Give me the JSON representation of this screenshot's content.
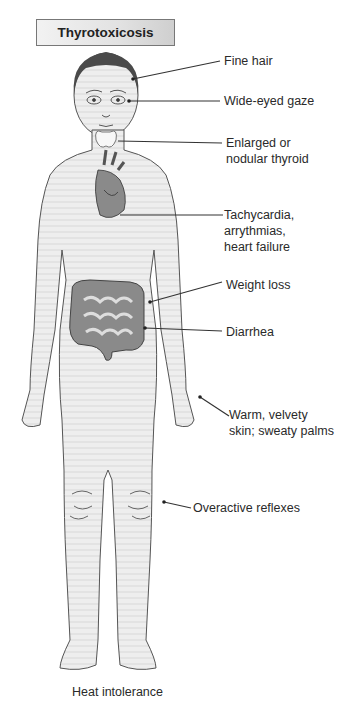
{
  "title": "Thyrotoxicosis",
  "labels": [
    {
      "id": "fine-hair",
      "text": "Fine hair"
    },
    {
      "id": "wide-eyed-gaze",
      "text": "Wide-eyed gaze"
    },
    {
      "id": "thyroid",
      "line1": "Enlarged or",
      "line2": "nodular thyroid"
    },
    {
      "id": "heart",
      "line1": "Tachycardia,",
      "line2": "arrythmias,",
      "line3": "heart failure"
    },
    {
      "id": "weight-loss",
      "text": "Weight loss"
    },
    {
      "id": "diarrhea",
      "text": "Diarrhea"
    },
    {
      "id": "skin",
      "line1": "Warm, velvety",
      "line2": "skin; sweaty palms"
    },
    {
      "id": "reflexes",
      "text": "Overactive reflexes"
    },
    {
      "id": "heat-intolerance",
      "text": "Heat intolerance"
    }
  ],
  "colors": {
    "skin": "#ececec",
    "outline": "#555555",
    "hair": "#4a4a4a",
    "intestine": "#8a8a8a",
    "heart": "#7a7a7a",
    "thyroid": "#f7f7f7"
  }
}
